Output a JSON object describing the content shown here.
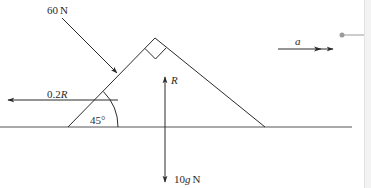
{
  "diagram": {
    "type": "force-diagram",
    "angle_label": "45°",
    "right_angle_marker": true,
    "forces": [
      {
        "id": "applied",
        "value": "60",
        "unit": "N",
        "direction": "down-right, perpendicular to left face"
      },
      {
        "id": "friction",
        "value": "0.2",
        "symbol": "R",
        "direction": "left"
      },
      {
        "id": "normal",
        "symbol": "R",
        "direction": "up"
      },
      {
        "id": "weight",
        "value": "10",
        "symbol": "g",
        "unit": "N",
        "direction": "down"
      }
    ],
    "acceleration": {
      "symbol": "a",
      "direction": "right"
    }
  },
  "labels": {
    "applied_value": "60",
    "applied_unit": "N",
    "friction_value": "0.2",
    "friction_symbol": "R",
    "angle": "45°",
    "normal_symbol": "R",
    "weight_value": "10",
    "weight_symbol": "g",
    "weight_unit": "N",
    "acceleration_symbol": "a"
  },
  "colors": {
    "ink": "#2a2a2a",
    "ground": "#555555",
    "connector": "#9a9a9a",
    "panel": "#f3f3f3"
  }
}
